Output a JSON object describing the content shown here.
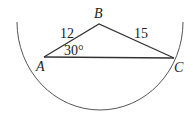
{
  "diagram": {
    "vertices": [
      {
        "name": "A",
        "x": 44,
        "y": 57
      },
      {
        "name": "B",
        "x": 99,
        "y": 24
      },
      {
        "name": "C",
        "x": 174,
        "y": 58
      }
    ],
    "labels": {
      "A": "A",
      "B": "B",
      "C": "C",
      "side_AB": "12",
      "side_BC": "15",
      "angle_A": "30°"
    },
    "stroke_color": "#333333",
    "arc_color": "#555555"
  }
}
